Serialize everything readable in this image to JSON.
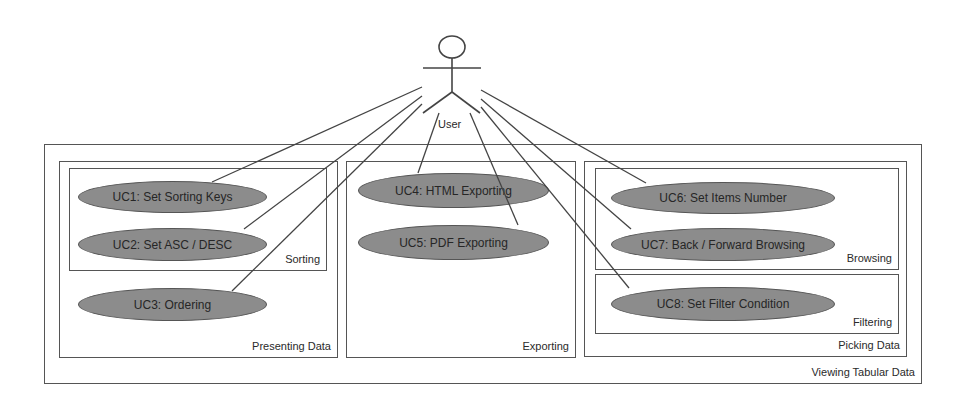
{
  "actor": {
    "label": "User"
  },
  "system": {
    "label": "Viewing Tabular Data"
  },
  "packages": {
    "presenting": {
      "label": "Presenting Data"
    },
    "sorting": {
      "label": "Sorting"
    },
    "exporting": {
      "label": "Exporting"
    },
    "picking": {
      "label": "Picking Data"
    },
    "browsing": {
      "label": "Browsing"
    },
    "filtering": {
      "label": "Filtering"
    }
  },
  "use_cases": [
    {
      "id": "UC1",
      "label": "UC1: Set Sorting Keys"
    },
    {
      "id": "UC2",
      "label": "UC2: Set ASC / DESC"
    },
    {
      "id": "UC3",
      "label": "UC3: Ordering"
    },
    {
      "id": "UC4",
      "label": "UC4: HTML Exporting"
    },
    {
      "id": "UC5",
      "label": "UC5: PDF Exporting"
    },
    {
      "id": "UC6",
      "label": "UC6: Set Items Number"
    },
    {
      "id": "UC7",
      "label": "UC7: Back / Forward Browsing"
    },
    {
      "id": "UC8",
      "label": "UC8: Set Filter Condition"
    }
  ],
  "colors": {
    "ellipse_fill": "#8c8c8c",
    "stroke": "#555555",
    "background": "#ffffff"
  }
}
